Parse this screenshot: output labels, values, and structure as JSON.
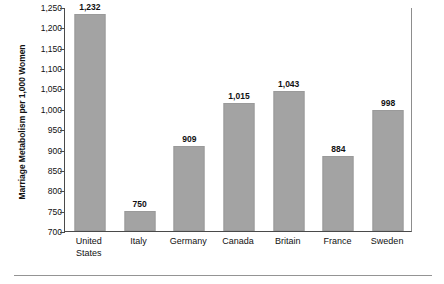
{
  "chart_data": {
    "type": "bar",
    "title": "",
    "xlabel": "",
    "ylabel": "Marriage Metabolism per 1,000 Women",
    "categories": [
      "United States",
      "Italy",
      "Germany",
      "Canada",
      "Britain",
      "France",
      "Sweden"
    ],
    "category_lines": [
      [
        "United",
        "States"
      ],
      [
        "Italy"
      ],
      [
        "Germany"
      ],
      [
        "Canada"
      ],
      [
        "Britain"
      ],
      [
        "France"
      ],
      [
        "Sweden"
      ]
    ],
    "values": [
      1232,
      750,
      909,
      1015,
      1043,
      884,
      998
    ],
    "value_labels": [
      "1,232",
      "750",
      "909",
      "1,015",
      "1,043",
      "884",
      "998"
    ],
    "ylim": [
      700,
      1250
    ],
    "ytick_values": [
      1250,
      1200,
      1150,
      1100,
      1050,
      1000,
      950,
      900,
      850,
      800,
      750,
      700
    ],
    "ytick_labels": [
      "1,250",
      "1,200",
      "1,150",
      "1,100",
      "1,050",
      "1,000",
      "950",
      "900",
      "850",
      "800",
      "750",
      "700"
    ],
    "grid": false,
    "legend": null,
    "bar_color": "#a3a3a3",
    "axis_color": "#4a4a4a"
  }
}
